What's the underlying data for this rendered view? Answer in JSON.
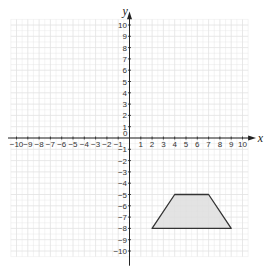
{
  "chart_data": {
    "type": "coordinate-grid",
    "title": "",
    "xlabel": "x",
    "ylabel": "y",
    "xlim": [
      -10,
      10
    ],
    "ylim": [
      -10,
      10
    ],
    "grid": true,
    "x_ticks": [
      -10,
      -9,
      -8,
      -7,
      -6,
      -5,
      -4,
      -3,
      -2,
      -1,
      1,
      2,
      3,
      4,
      5,
      6,
      7,
      8,
      9,
      10
    ],
    "y_ticks": [
      10,
      9,
      8,
      7,
      6,
      5,
      4,
      3,
      2,
      1,
      -1,
      -2,
      -3,
      -4,
      -5,
      -6,
      -7,
      -8,
      -9,
      -10
    ],
    "origin_label": "0",
    "shapes": [
      {
        "type": "polygon",
        "name": "trapezoid",
        "vertices": [
          [
            2,
            -8
          ],
          [
            4,
            -5
          ],
          [
            7,
            -5
          ],
          [
            9,
            -8
          ]
        ],
        "fill": "#dedede",
        "stroke": "#333333"
      }
    ]
  },
  "colors": {
    "grid": "#e2e2e2",
    "axis": "#222222",
    "shape_fill": "#dedede",
    "shape_stroke": "#333333"
  }
}
